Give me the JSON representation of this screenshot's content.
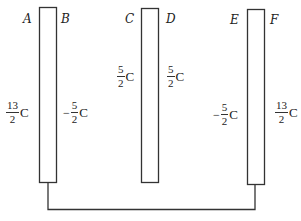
{
  "diagram": {
    "type": "parallel-plate conductors",
    "colors": {
      "stroke": "#333333",
      "background": "#ffffff",
      "text": "#222222"
    },
    "plates": [
      {
        "id": "plate-1",
        "left_face": "A",
        "right_face": "B"
      },
      {
        "id": "plate-2",
        "left_face": "C",
        "right_face": "D"
      },
      {
        "id": "plate-3",
        "left_face": "E",
        "right_face": "F"
      }
    ],
    "labels": {
      "A": "A",
      "B": "B",
      "C": "C",
      "D": "D",
      "E": "E",
      "F": "F"
    },
    "charges": {
      "A": {
        "sign": "",
        "num": "13",
        "den": "2",
        "unit": "C"
      },
      "B": {
        "sign": "−",
        "num": "5",
        "den": "2",
        "unit": "C"
      },
      "C": {
        "sign": "",
        "num": "5",
        "den": "2",
        "unit": "C"
      },
      "D": {
        "sign": "",
        "num": "5",
        "den": "2",
        "unit": "C"
      },
      "E": {
        "sign": "−",
        "num": "5",
        "den": "2",
        "unit": "C"
      },
      "F": {
        "sign": "",
        "num": "13",
        "den": "2",
        "unit": "C"
      }
    },
    "connection": "wire connecting bottom of plate 1 to bottom of plate 3"
  }
}
